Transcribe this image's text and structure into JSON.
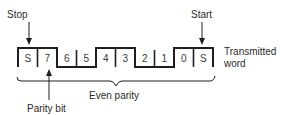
{
  "diagram": {
    "title_labels": {
      "stop": "Stop",
      "start": "Start",
      "transmitted_line1": "Transmitted",
      "transmitted_line2": "word",
      "even_parity": "Even parity",
      "parity_bit": "Parity bit"
    },
    "bits": [
      {
        "label": "S",
        "level": 1,
        "role": "stop"
      },
      {
        "label": "7",
        "level": 1,
        "role": "parity"
      },
      {
        "label": "6",
        "level": 0,
        "role": "data"
      },
      {
        "label": "5",
        "level": 0,
        "role": "data"
      },
      {
        "label": "4",
        "level": 1,
        "role": "data"
      },
      {
        "label": "3",
        "level": 1,
        "role": "data"
      },
      {
        "label": "2",
        "level": 0,
        "role": "data"
      },
      {
        "label": "1",
        "level": 0,
        "role": "data"
      },
      {
        "label": "0",
        "level": 1,
        "role": "data"
      },
      {
        "label": "S",
        "level": 1,
        "role": "start"
      }
    ],
    "line_color": "#1e1e1e"
  }
}
